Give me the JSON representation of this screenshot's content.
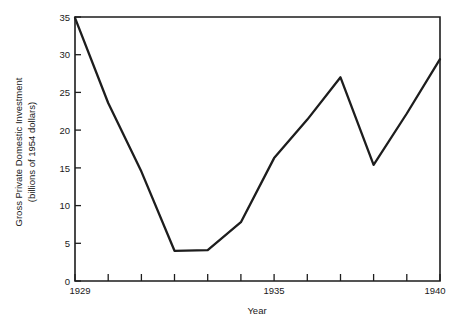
{
  "chart_data": {
    "type": "line",
    "title": "",
    "subtitle": "",
    "xlabel": "Year",
    "ylabel": "Gross Private Domestic Investment (billions of 1954 dollars)",
    "ylabel_line1": "Gross Private Domestic Investment",
    "ylabel_line2": "(billions of 1954 dollars)",
    "x": [
      1929,
      1930,
      1931,
      1932,
      1933,
      1934,
      1935,
      1936,
      1937,
      1938,
      1939,
      1940
    ],
    "values": [
      34.9,
      23.6,
      14.5,
      4.0,
      4.1,
      7.8,
      16.3,
      21.4,
      27.0,
      15.4,
      22.2,
      29.4
    ],
    "series": [
      {
        "name": "Gross Private Domestic Investment",
        "values": [
          34.9,
          23.6,
          14.5,
          4.0,
          4.1,
          7.8,
          16.3,
          21.4,
          27.0,
          15.4,
          22.2,
          29.4
        ]
      }
    ],
    "xlim": [
      1929,
      1940
    ],
    "ylim": [
      0,
      35
    ],
    "x_ticks": [
      1929,
      1930,
      1931,
      1932,
      1933,
      1934,
      1935,
      1936,
      1937,
      1938,
      1939,
      1940
    ],
    "x_tick_labels": [
      "1929",
      "",
      "",
      "",
      "",
      "",
      "1935",
      "",
      "",
      "",
      "",
      "1940"
    ],
    "y_ticks": [
      0,
      5,
      10,
      15,
      20,
      25,
      30,
      35
    ],
    "y_tick_labels": [
      "0",
      "5",
      "10",
      "15",
      "20",
      "25",
      "30",
      "35"
    ],
    "grid": false,
    "legend": false,
    "legend_position": "none",
    "line_color": "#1d1d1d",
    "axis_color": "#1d1d1d",
    "background_color": "#ffffff"
  }
}
